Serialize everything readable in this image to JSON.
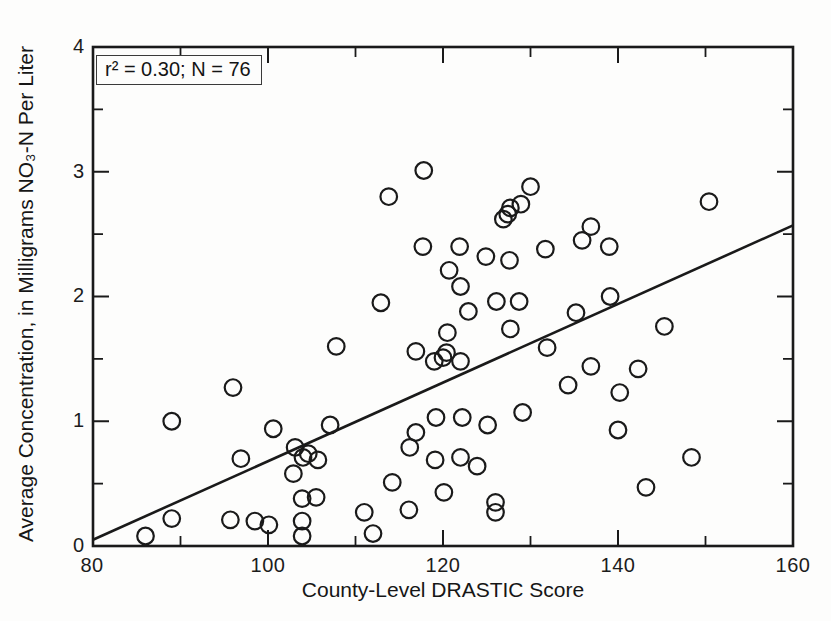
{
  "figure": {
    "annotation": "r² = 0.30; N = 76",
    "x_axis": {
      "title": "County-Level DRASTIC Score",
      "tick_labels": [
        "80",
        "100",
        "120",
        "140",
        "160"
      ]
    },
    "y_axis": {
      "title": "Average Concentration, in Milligrams NO₃-N Per Liter",
      "tick_labels": [
        "0",
        "1",
        "2",
        "3",
        "4"
      ]
    }
  },
  "chart_data": {
    "type": "scatter",
    "title": "",
    "xlabel": "County-Level DRASTIC Score",
    "ylabel": "Average Concentration, in Milligrams NO₃-N Per Liter",
    "xlim": [
      80,
      160
    ],
    "ylim": [
      0,
      4
    ],
    "x_major_ticks": [
      80,
      100,
      120,
      140,
      160
    ],
    "x_minor_ticks": [
      90,
      110,
      130,
      150
    ],
    "y_major_ticks": [
      0,
      1,
      2,
      3,
      4
    ],
    "y_minor_ticks": [
      0.5,
      1.5,
      2.5,
      3.5
    ],
    "grid": false,
    "legend": "none",
    "marker": "open-circle",
    "annotation": "r² = 0.30; N = 76",
    "r_squared": 0.3,
    "n": 76,
    "regression_line": {
      "x": [
        80,
        160
      ],
      "y": [
        0.05,
        2.57
      ]
    },
    "points": [
      [
        86.0,
        0.08
      ],
      [
        89.0,
        0.22
      ],
      [
        89.0,
        1.0
      ],
      [
        96.0,
        1.27
      ],
      [
        95.7,
        0.21
      ],
      [
        96.9,
        0.7
      ],
      [
        98.5,
        0.2
      ],
      [
        100.1,
        0.17
      ],
      [
        100.6,
        0.94
      ],
      [
        102.9,
        0.58
      ],
      [
        103.1,
        0.79
      ],
      [
        104.0,
        0.71
      ],
      [
        104.6,
        0.74
      ],
      [
        105.7,
        0.69
      ],
      [
        103.9,
        0.38
      ],
      [
        105.5,
        0.39
      ],
      [
        103.9,
        0.2
      ],
      [
        103.9,
        0.08
      ],
      [
        107.1,
        0.97
      ],
      [
        107.8,
        1.6
      ],
      [
        111.0,
        0.27
      ],
      [
        112.0,
        0.1
      ],
      [
        112.9,
        1.95
      ],
      [
        113.8,
        2.8
      ],
      [
        114.2,
        0.51
      ],
      [
        116.1,
        0.29
      ],
      [
        116.2,
        0.79
      ],
      [
        116.9,
        0.91
      ],
      [
        116.9,
        1.56
      ],
      [
        117.8,
        3.01
      ],
      [
        117.7,
        2.4
      ],
      [
        119.0,
        1.48
      ],
      [
        119.2,
        1.03
      ],
      [
        119.1,
        0.69
      ],
      [
        120.1,
        0.43
      ],
      [
        120.5,
        1.71
      ],
      [
        120.0,
        1.51
      ],
      [
        120.4,
        1.55
      ],
      [
        120.7,
        2.21
      ],
      [
        121.9,
        2.4
      ],
      [
        122.0,
        2.08
      ],
      [
        122.0,
        1.48
      ],
      [
        122.2,
        1.03
      ],
      [
        122.0,
        0.71
      ],
      [
        122.9,
        1.88
      ],
      [
        123.9,
        0.64
      ],
      [
        124.9,
        2.32
      ],
      [
        125.1,
        0.97
      ],
      [
        126.1,
        1.96
      ],
      [
        126.0,
        0.35
      ],
      [
        126.0,
        0.27
      ],
      [
        127.6,
        2.29
      ],
      [
        127.7,
        1.74
      ],
      [
        126.9,
        2.62
      ],
      [
        127.4,
        2.66
      ],
      [
        127.7,
        2.71
      ],
      [
        128.9,
        2.74
      ],
      [
        130.0,
        2.88
      ],
      [
        128.7,
        1.96
      ],
      [
        129.1,
        1.07
      ],
      [
        131.7,
        2.38
      ],
      [
        131.9,
        1.59
      ],
      [
        134.3,
        1.29
      ],
      [
        135.2,
        1.87
      ],
      [
        135.9,
        2.45
      ],
      [
        136.9,
        2.56
      ],
      [
        136.9,
        1.44
      ],
      [
        139.0,
        2.4
      ],
      [
        139.1,
        2.0
      ],
      [
        140.2,
        1.23
      ],
      [
        140.0,
        0.93
      ],
      [
        142.3,
        1.42
      ],
      [
        143.2,
        0.47
      ],
      [
        145.3,
        1.76
      ],
      [
        148.4,
        0.71
      ],
      [
        150.4,
        2.76
      ]
    ]
  },
  "colors": {
    "ink": "#1a1a1a",
    "paper": "#fdfdfc",
    "annotation_border": "#3a3a3a"
  }
}
